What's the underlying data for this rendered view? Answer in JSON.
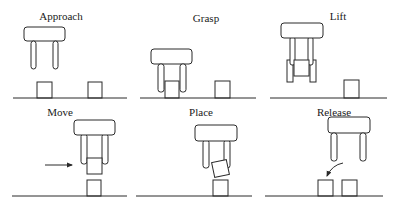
{
  "figure": {
    "panels": [
      {
        "id": "approach",
        "label": "Approach",
        "row": 1,
        "col": 1
      },
      {
        "id": "grasp",
        "label": "Grasp",
        "row": 1,
        "col": 2
      },
      {
        "id": "lift",
        "label": "Lift",
        "row": 1,
        "col": 3
      },
      {
        "id": "move",
        "label": "Move",
        "row": 2,
        "col": 1
      },
      {
        "id": "place",
        "label": "Place",
        "row": 2,
        "col": 2
      },
      {
        "id": "release",
        "label": "Release",
        "row": 2,
        "col": 3
      }
    ],
    "colors": {
      "line": "#2a2a2a",
      "background": "#ffffff",
      "text": "#1a1a1a"
    }
  }
}
